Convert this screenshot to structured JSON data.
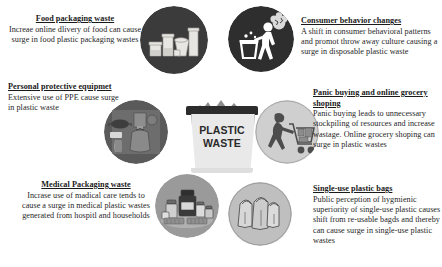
{
  "diagram": {
    "center": {
      "label_line1": "PLASTIC",
      "label_line2": "WASTE",
      "icon": "trash-bin-icon",
      "bin_body_color": "#e9e9e9",
      "bin_lid_color": "#2c2c2c"
    },
    "nodes": [
      {
        "id": "food-packaging-waste",
        "title": "Food packaging waste",
        "body": "Increae online dlivery of food can cause surge in food plastic packaging wastes",
        "icon": "plastic-food-containers-icon",
        "circle_fill": "#3b3b3b",
        "text_align": "center",
        "position": "top-left"
      },
      {
        "id": "consumer-behavior-changes",
        "title": "Consumer behavior changes",
        "body": "A shift in consumer behavioral patterns and promot throw away culture causing a surge in disposable plastic waste",
        "icon": "person-throwing-trash-icon",
        "circle_fill": "#2e2e2e",
        "text_align": "left",
        "position": "top-right"
      },
      {
        "id": "personal-protective-equipment",
        "title": "Personal protective equipmet",
        "body": "Extensive use of PPE cause surge in plastic waste",
        "icon": "ppe-kit-icon",
        "circle_fill": "#5a5a5a",
        "text_align": "left",
        "position": "mid-left"
      },
      {
        "id": "panic-buying-online-grocery-shopping",
        "title": "Panic buying and online grocery shoping",
        "body": "Panic buying leads to unnecessary stockpiling of resources and increase wastage. Online grocery shoping can surge in plastic wastes",
        "icon": "shopping-cart-person-icon",
        "circle_fill": "#cfcfcf",
        "text_align": "left",
        "position": "mid-right"
      },
      {
        "id": "medical-packaging-waste",
        "title": "Medical Packaging waste",
        "body": "Incrase use of madical care tends to cause a surge in medical plastic wastes generated from hospitl and households",
        "icon": "medicine-bottles-icon",
        "circle_fill": "#9a9a9a",
        "text_align": "center",
        "position": "bottom-left"
      },
      {
        "id": "single-use-plastic-bags",
        "title": "Single-use plastic bags",
        "body": "Public perception of hygmienic superiority of single-use plastic causes shift from re-usable bagds and thereby can cause surge in single-use plastic wastes",
        "icon": "plastic-shopping-bags-icon",
        "circle_fill": "#bfbfbf",
        "text_align": "left",
        "position": "bottom-right"
      }
    ]
  }
}
